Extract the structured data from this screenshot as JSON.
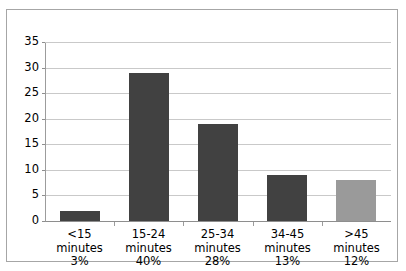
{
  "chart_data": {
    "type": "bar",
    "title": "",
    "xlabel": "",
    "ylabel": "",
    "ylim": [
      0,
      35
    ],
    "ytick_step": 5,
    "yticks": [
      0,
      5,
      10,
      15,
      20,
      25,
      30,
      35
    ],
    "grid": true,
    "legend": false,
    "categories": [
      "<15 minutes",
      "15-24 minutes",
      "25-34 minutes",
      "34-45 minutes",
      ">45 minutes"
    ],
    "values": [
      2,
      29,
      19,
      9,
      8
    ],
    "percent_labels": [
      "3%",
      "40%",
      "28%",
      "13%",
      "12%"
    ],
    "bar_colors": [
      "#414141",
      "#414141",
      "#414141",
      "#414141",
      "#9a9a9a"
    ],
    "category_lines": [
      [
        "<15",
        "minutes",
        "3%"
      ],
      [
        "15-24",
        "minutes",
        "40%"
      ],
      [
        "25-34",
        "minutes",
        "28%"
      ],
      [
        "34-45",
        "minutes",
        "13%"
      ],
      [
        ">45",
        "minutes",
        "12%"
      ]
    ]
  },
  "style": {
    "bar_dark": "#414141",
    "bar_light": "#9a9a9a",
    "gridline": "#c9c9c9",
    "axis": "#8e8e8e",
    "frame_border": "#a6a6a6",
    "plot_background": "#ffffff"
  }
}
